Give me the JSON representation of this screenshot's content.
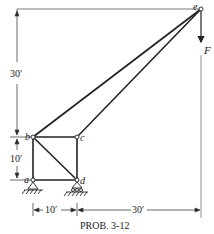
{
  "caption": "PROB. 3-12",
  "nodes": {
    "a": {
      "label": "a",
      "x": 33,
      "y": 180
    },
    "b": {
      "label": "b",
      "x": 33,
      "y": 137
    },
    "c": {
      "label": "c",
      "x": 77,
      "y": 137
    },
    "d": {
      "label": "d",
      "x": 77,
      "y": 180
    },
    "e": {
      "label": "e",
      "x": 201,
      "y": 9
    }
  },
  "members": [
    [
      "a",
      "b"
    ],
    [
      "b",
      "c"
    ],
    [
      "c",
      "d"
    ],
    [
      "a",
      "d"
    ],
    [
      "b",
      "d"
    ],
    [
      "b",
      "e"
    ],
    [
      "c",
      "e"
    ]
  ],
  "load": {
    "label": "F",
    "direction": "down",
    "at": "e"
  },
  "supports": {
    "a": "pin",
    "d": "roller"
  },
  "dimensions": {
    "vertical_top": "30′",
    "vertical_bottom": "10′",
    "horizontal_left": "10′",
    "horizontal_right": "30′"
  },
  "colors": {
    "line": "#222222",
    "dim": "#444444"
  }
}
